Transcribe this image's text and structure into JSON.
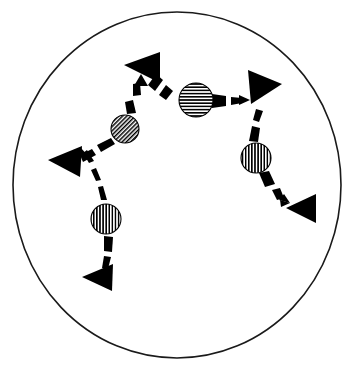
{
  "figure": {
    "title": "",
    "caption": "",
    "background_color": "#ffffff",
    "stroke_color": "#000000",
    "fill_color": "#000000",
    "width": 354,
    "height": 366
  },
  "boundary": {
    "name": "enclosing-circle",
    "shape": "circle",
    "cx": 177,
    "cy": 185,
    "rx": 164,
    "ry": 173,
    "stroke_width": 1.6,
    "stroke_color": "#1a1a1a",
    "fill": "none"
  },
  "balls": [
    {
      "id": "ball-upper-left",
      "label": "",
      "cx": 125,
      "cy": 129,
      "r": 14,
      "hatch": "diagonal",
      "hatch_angle_deg": 45,
      "color": "#000000"
    },
    {
      "id": "ball-center",
      "label": "",
      "cx": 196,
      "cy": 100,
      "r": 17,
      "hatch": "horizontal",
      "hatch_angle_deg": 0,
      "color": "#000000"
    },
    {
      "id": "ball-right",
      "label": "",
      "cx": 256,
      "cy": 158,
      "r": 15,
      "hatch": "vertical",
      "hatch_angle_deg": 90,
      "color": "#000000"
    },
    {
      "id": "ball-lower-left",
      "label": "",
      "cx": 106,
      "cy": 219,
      "r": 15,
      "hatch": "vertical",
      "hatch_angle_deg": 90,
      "color": "#000000"
    }
  ],
  "arrowheads": [
    {
      "id": "arrowhead-top",
      "label": "",
      "cx": 142,
      "cy": 65,
      "size": 27,
      "rotation_deg": 200,
      "direction": "up-left",
      "color": "#000000"
    },
    {
      "id": "arrowhead-upper-right",
      "label": "",
      "cx": 261,
      "cy": 87,
      "size": 27,
      "rotation_deg": 20,
      "direction": "right",
      "color": "#000000"
    },
    {
      "id": "arrowhead-left",
      "label": "",
      "cx": 66,
      "cy": 162,
      "size": 27,
      "rotation_deg": 195,
      "direction": "left",
      "color": "#000000"
    },
    {
      "id": "arrowhead-lower-right",
      "label": "",
      "cx": 302,
      "cy": 209,
      "size": 26,
      "rotation_deg": 185,
      "direction": "left",
      "color": "#000000"
    },
    {
      "id": "arrowhead-bottom-left",
      "label": "",
      "cx": 99,
      "cy": 277,
      "size": 26,
      "rotation_deg": 190,
      "direction": "left",
      "color": "#000000"
    }
  ],
  "trails": [
    {
      "id": "trail-ball-upper-left-to-top",
      "label": "",
      "from": "ball-upper-left",
      "to": "arrowhead-top",
      "style": "dashed-tapered",
      "has_arrow_tip": true
    },
    {
      "id": "trail-ball-upper-left-to-left",
      "label": "",
      "from": "ball-upper-left",
      "to": "arrowhead-left",
      "style": "dashed-tapered",
      "has_arrow_tip": false
    },
    {
      "id": "trail-top-to-ball-center",
      "label": "",
      "from": "arrowhead-top",
      "to": "ball-center",
      "style": "dashed-tapered",
      "has_arrow_tip": false
    },
    {
      "id": "trail-ball-center-to-upper-right",
      "label": "",
      "from": "ball-center",
      "to": "arrowhead-upper-right",
      "style": "dashed-tapered",
      "has_arrow_tip": true
    },
    {
      "id": "trail-upper-right-to-ball-right",
      "label": "",
      "from": "arrowhead-upper-right",
      "to": "ball-right",
      "style": "dashed-tapered",
      "has_arrow_tip": false
    },
    {
      "id": "trail-ball-right-to-lower-right",
      "label": "",
      "from": "ball-right",
      "to": "arrowhead-lower-right",
      "style": "dashed-tapered",
      "has_arrow_tip": true
    },
    {
      "id": "trail-ball-lower-left-to-left",
      "label": "",
      "from": "ball-lower-left",
      "to": "arrowhead-left",
      "style": "dashed-tapered",
      "has_arrow_tip": true
    },
    {
      "id": "trail-bottom-left-to-ball-lower-left",
      "label": "",
      "from": "arrowhead-bottom-left",
      "to": "ball-lower-left",
      "style": "dashed-tapered",
      "has_arrow_tip": false
    }
  ]
}
